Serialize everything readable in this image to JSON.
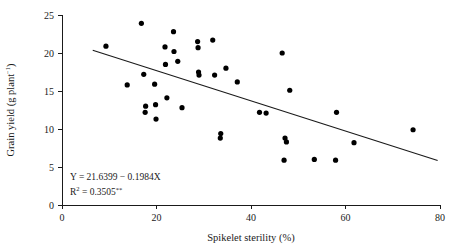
{
  "chart_data": {
    "type": "scatter",
    "title": "",
    "xlabel": "Spikelet sterility (%)",
    "ylabel": "Grain yield (g plant−1)",
    "ylabel_base": "Grain yield (g plant",
    "ylabel_sup": "−1",
    "ylabel_close": ")",
    "xlim": [
      0,
      80
    ],
    "ylim": [
      0,
      25
    ],
    "xticks": [
      0,
      20,
      40,
      60,
      80
    ],
    "yticks": [
      0,
      5,
      10,
      15,
      20,
      25
    ],
    "xtick_labels": [
      "0",
      "20",
      "40",
      "60",
      "80"
    ],
    "ytick_labels": [
      "0",
      "5",
      "10",
      "15",
      "20",
      "25"
    ],
    "grid": false,
    "legend": "none",
    "marker": "filled-circle",
    "marker_color": "#000000",
    "line_color": "#1a1a1a",
    "points": [
      {
        "x": 9.3,
        "y": 20.9
      },
      {
        "x": 13.8,
        "y": 15.8
      },
      {
        "x": 16.8,
        "y": 23.9
      },
      {
        "x": 17.3,
        "y": 17.2
      },
      {
        "x": 17.7,
        "y": 13.0
      },
      {
        "x": 17.6,
        "y": 12.2
      },
      {
        "x": 19.6,
        "y": 15.9
      },
      {
        "x": 19.8,
        "y": 13.2
      },
      {
        "x": 19.9,
        "y": 11.3
      },
      {
        "x": 21.8,
        "y": 20.8
      },
      {
        "x": 21.9,
        "y": 18.5
      },
      {
        "x": 22.2,
        "y": 14.1
      },
      {
        "x": 23.6,
        "y": 22.8
      },
      {
        "x": 23.7,
        "y": 20.2
      },
      {
        "x": 24.5,
        "y": 18.9
      },
      {
        "x": 25.4,
        "y": 12.8
      },
      {
        "x": 28.7,
        "y": 21.5
      },
      {
        "x": 28.8,
        "y": 20.7
      },
      {
        "x": 28.9,
        "y": 17.5
      },
      {
        "x": 29.0,
        "y": 17.1
      },
      {
        "x": 31.9,
        "y": 21.7
      },
      {
        "x": 32.3,
        "y": 17.1
      },
      {
        "x": 33.6,
        "y": 9.4
      },
      {
        "x": 33.5,
        "y": 8.8
      },
      {
        "x": 34.7,
        "y": 18.0
      },
      {
        "x": 37.1,
        "y": 16.2
      },
      {
        "x": 41.8,
        "y": 12.2
      },
      {
        "x": 43.2,
        "y": 12.1
      },
      {
        "x": 46.6,
        "y": 20.0
      },
      {
        "x": 47.2,
        "y": 8.8
      },
      {
        "x": 47.5,
        "y": 8.3
      },
      {
        "x": 47.0,
        "y": 5.9
      },
      {
        "x": 48.2,
        "y": 15.1
      },
      {
        "x": 53.4,
        "y": 6.0
      },
      {
        "x": 57.9,
        "y": 5.9
      },
      {
        "x": 58.1,
        "y": 12.2
      },
      {
        "x": 61.8,
        "y": 8.2
      },
      {
        "x": 74.3,
        "y": 9.9
      }
    ],
    "regression": {
      "intercept": 21.6399,
      "slope": -0.1984,
      "x_start": 6.5,
      "x_end": 79.5,
      "equation": "Y = 21.6399 − 0.1984X",
      "r2_prefix": "R",
      "r2_sup": "2",
      "r2_value": " = 0.3505",
      "r2_significance": "**"
    }
  }
}
